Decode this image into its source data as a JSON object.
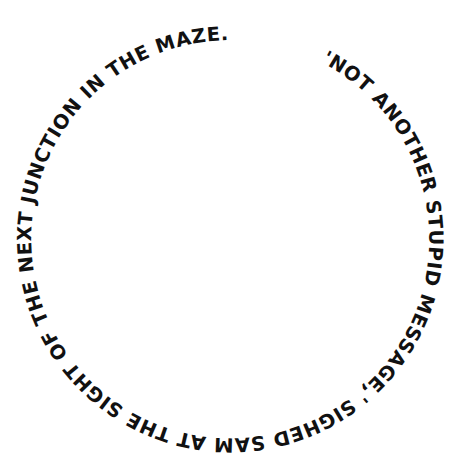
{
  "artwork": {
    "type": "circular-text",
    "text": "'NOT ANOTHER STUPID MESSAGE,' SIGHED SAM AT THE SIGHT OF THE NEXT JUNCTION IN THE MAZE.",
    "text_color": "#111111",
    "background_color": "#ffffff",
    "circle": {
      "cx": 228,
      "cy": 238,
      "r": 199
    },
    "start_angle_deg": -64,
    "gap_note": "Open gap at top between 'MAZE.' and \"'NOT\""
  }
}
